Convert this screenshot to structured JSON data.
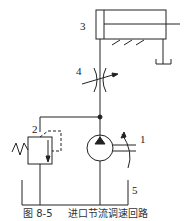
{
  "diagram": {
    "caption_figure": "图 8-5",
    "caption_text": "进口节流调速回路",
    "components": [
      {
        "id": "1",
        "label": "1",
        "name": "hydraulic pump"
      },
      {
        "id": "2",
        "label": "2",
        "name": "relief valve"
      },
      {
        "id": "3",
        "label": "3",
        "name": "hydraulic cylinder"
      },
      {
        "id": "4",
        "label": "4",
        "name": "throttle valve"
      },
      {
        "id": "5",
        "label": "5",
        "name": "oil tank"
      }
    ],
    "colors": {
      "line": "#222222",
      "background": "#ffffff"
    }
  }
}
